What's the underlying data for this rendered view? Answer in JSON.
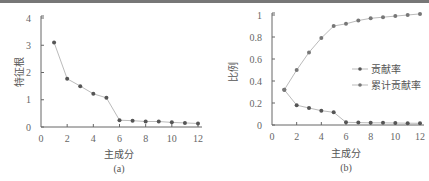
{
  "chart_data": [
    {
      "type": "line",
      "panel": "(a)",
      "title": "",
      "xlabel": "主成分",
      "ylabel": "特征根",
      "xlim": [
        0,
        12
      ],
      "ylim": [
        0,
        4
      ],
      "xticks": [
        0,
        2,
        4,
        6,
        8,
        10,
        12
      ],
      "yticks": [
        0,
        1,
        2,
        3,
        4
      ],
      "grid": false,
      "x": [
        1,
        2,
        3,
        4,
        5,
        6,
        7,
        8,
        9,
        10,
        11,
        12
      ],
      "series": [
        {
          "name": "特征根",
          "values": [
            3.1,
            1.77,
            1.5,
            1.22,
            1.07,
            0.25,
            0.23,
            0.2,
            0.2,
            0.17,
            0.15,
            0.13
          ]
        }
      ]
    },
    {
      "type": "line",
      "panel": "(b)",
      "title": "",
      "xlabel": "主成分",
      "ylabel": "比例",
      "xlim": [
        0,
        12
      ],
      "ylim": [
        0,
        1
      ],
      "xticks": [
        0,
        2,
        4,
        6,
        8,
        10,
        12
      ],
      "yticks": [
        0,
        0.2,
        0.4,
        0.6,
        0.8,
        1
      ],
      "grid": false,
      "legend_position": "center-right",
      "x": [
        1,
        2,
        3,
        4,
        5,
        6,
        7,
        8,
        9,
        10,
        11,
        12
      ],
      "series": [
        {
          "name": "贡献率",
          "values": [
            0.32,
            0.18,
            0.155,
            0.13,
            0.115,
            0.025,
            0.022,
            0.02,
            0.02,
            0.018,
            0.016,
            0.015
          ]
        },
        {
          "name": "累计贡献率",
          "values": [
            0.32,
            0.5,
            0.66,
            0.79,
            0.9,
            0.92,
            0.95,
            0.97,
            0.98,
            0.99,
            1.0,
            1.01
          ]
        }
      ]
    }
  ],
  "panels": {
    "a": {
      "caption": "(a)",
      "xlabel": "主成分",
      "ylabel": "特征根",
      "yticks": [
        "0",
        "1",
        "2",
        "3",
        "4"
      ],
      "xticks": [
        "0",
        "2",
        "4",
        "6",
        "8",
        "10",
        "12"
      ]
    },
    "b": {
      "caption": "(b)",
      "xlabel": "主成分",
      "ylabel": "比例",
      "yticks": [
        "0",
        "0.2",
        "0.4",
        "0.6",
        "0.8",
        "1"
      ],
      "xticks": [
        "0",
        "2",
        "4",
        "6",
        "8",
        "10",
        "12"
      ],
      "legend": [
        "贡献率",
        "累计贡献率"
      ]
    }
  },
  "colors": {
    "axis": "#666666",
    "line": "#bbbbbb",
    "marker": "#555555"
  }
}
